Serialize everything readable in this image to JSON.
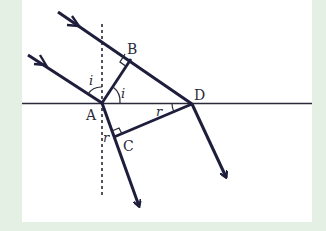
{
  "figure": {
    "colors": {
      "background": "#e3f0e3",
      "panel": "#ffffff",
      "ray": "#1e1e3c",
      "line": "#2a2a3a"
    },
    "points": {
      "A": {
        "label": "A",
        "x": 102,
        "y": 103
      },
      "B": {
        "label": "B",
        "x": 131,
        "y": 59
      },
      "C": {
        "label": "C",
        "x": 118,
        "y": 136
      },
      "D": {
        "label": "D",
        "x": 192,
        "y": 104
      }
    },
    "angles": {
      "incident_left": "i",
      "incident_right": "i",
      "refracted_D": "r",
      "refracted_C": "r"
    },
    "elements": [
      "interface-line",
      "normal-dashed-line",
      "incident-ray-upper",
      "incident-ray-lower",
      "wavefront-AB",
      "wavefront-CD",
      "refracted-ray-A",
      "refracted-ray-D"
    ]
  }
}
